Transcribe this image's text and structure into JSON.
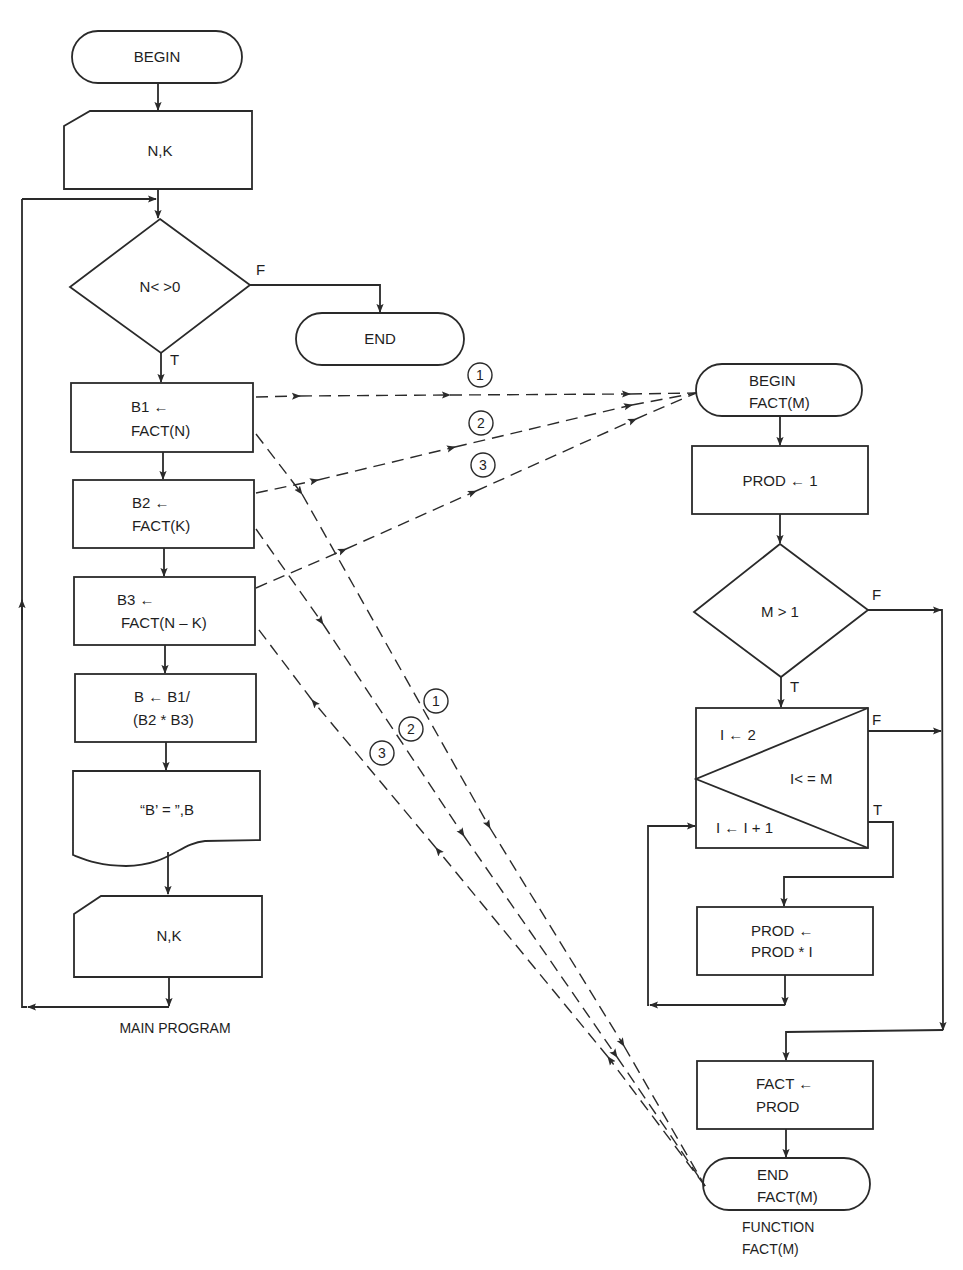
{
  "main_program": {
    "caption": "MAIN PROGRAM",
    "begin": "BEGIN",
    "input_1": "N,K",
    "decision": "N< >0",
    "decision_false": "F",
    "decision_true": "T",
    "end": "END",
    "b1": [
      "B1 ←",
      "FACT(N)"
    ],
    "b2": [
      "B2 ←",
      "FACT(K)"
    ],
    "b3": [
      "B3 ←",
      "FACT(N – K)"
    ],
    "b_calc": [
      "B ← B1/",
      "(B2 * B3)"
    ],
    "output": "“B’ = ”,B",
    "input_2": "N,K"
  },
  "function": {
    "caption": [
      "FUNCTION",
      "FACT(M)"
    ],
    "begin": [
      "BEGIN",
      "FACT(M)"
    ],
    "init": "PROD ← 1",
    "decision": "M > 1",
    "decision_false": "F",
    "decision_true": "T",
    "loop": {
      "init": "I ← 2",
      "test": "I< = M",
      "increment": "I ← I + 1",
      "false_label": "F",
      "true_label": "T"
    },
    "body": [
      "PROD ←",
      "PROD * I"
    ],
    "assign": [
      "FACT ←",
      "PROD"
    ],
    "end": [
      "END",
      "FACT(M)"
    ]
  },
  "call_markers": {
    "calls": [
      "1",
      "2",
      "3"
    ],
    "returns": [
      "1",
      "2",
      "3"
    ]
  },
  "colors": {
    "ink": "#2a2a2a",
    "paper": "#ffffff"
  }
}
